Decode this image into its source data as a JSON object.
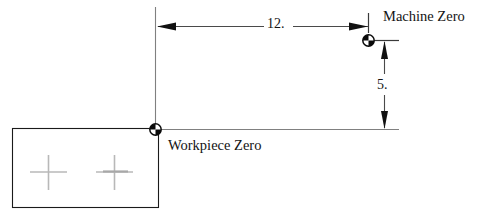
{
  "diagram": {
    "type": "engineering-dimension-drawing",
    "labels": {
      "machine_zero": "Machine Zero",
      "workpiece_zero": "Workpiece Zero"
    },
    "dimensions": [
      {
        "id": "horizontal-offset",
        "value": "12.",
        "orientation": "horizontal",
        "from": "workpiece-zero",
        "to": "machine-zero",
        "arrowheads": "both"
      },
      {
        "id": "vertical-offset",
        "value": "5.",
        "orientation": "vertical",
        "from": "machine-zero",
        "to": "workpiece-zero-baseline",
        "arrowheads": "both"
      }
    ],
    "symbols": [
      {
        "id": "workpiece-zero-datum",
        "kind": "quadrant-circle-datum",
        "x": 155,
        "y": 129
      },
      {
        "id": "machine-zero-datum",
        "kind": "quadrant-circle-datum",
        "x": 368,
        "y": 40
      }
    ],
    "workpiece": {
      "id": "workpiece-rectangle",
      "x": 12,
      "y": 128,
      "width": 146,
      "height": 80,
      "stroke": "#1a1a1a",
      "crosshairs": [
        {
          "id": "crosshair-left",
          "cx": 48,
          "cy": 172
        },
        {
          "id": "crosshair-right",
          "cx": 114,
          "cy": 172
        }
      ]
    },
    "colors": {
      "line": "#6e6e6e",
      "heavy_line": "#1a1a1a",
      "text": "#141414",
      "crosshair": "#b4b4b4",
      "background": "#ffffff"
    }
  }
}
